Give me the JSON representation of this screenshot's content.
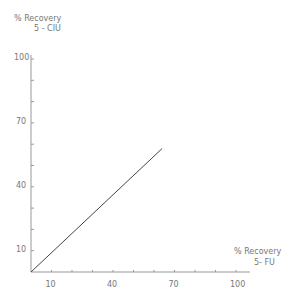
{
  "chart_data": {
    "type": "line",
    "title": "",
    "xlabel": "% Recovery 5- FU",
    "ylabel": "% Recovery 5 - CIU",
    "xlabel_lines": [
      "%  Recovery",
      "5- FU"
    ],
    "ylabel_lines": [
      "%  Recovery",
      "5 - CIU"
    ],
    "x_ticks": [
      10,
      40,
      70,
      100
    ],
    "y_ticks": [
      10,
      40,
      70,
      100
    ],
    "xlim": [
      0,
      105
    ],
    "ylim": [
      0,
      105
    ],
    "grid": false,
    "series": [
      {
        "name": "regression line",
        "x": [
          0,
          64
        ],
        "y": [
          0,
          58
        ]
      }
    ]
  }
}
